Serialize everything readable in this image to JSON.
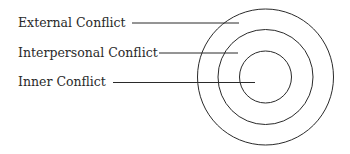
{
  "diagram": {
    "type": "concentric-circles",
    "stroke_color": "#2a2a2a",
    "labels": [
      {
        "text": "External Conflict",
        "ring": "outer"
      },
      {
        "text": "Interpersonal Conflict",
        "ring": "middle"
      },
      {
        "text": "Inner Conflict",
        "ring": "inner"
      }
    ]
  }
}
